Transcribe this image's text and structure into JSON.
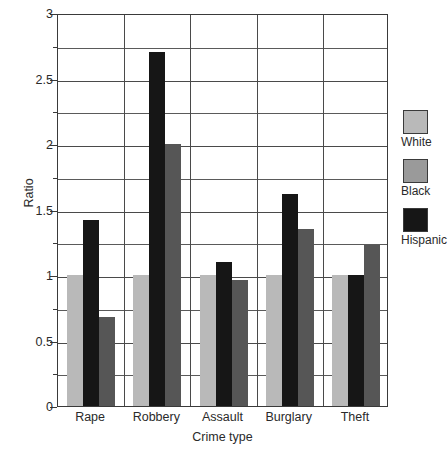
{
  "chart_data": {
    "type": "bar",
    "title": "",
    "xlabel": "Crime type",
    "ylabel": "Ratio",
    "categories": [
      "Rape",
      "Robbery",
      "Assault",
      "Burglary",
      "Theft"
    ],
    "series": [
      {
        "name": "White",
        "color": "#b9b9b9",
        "values": [
          1.0,
          1.0,
          1.0,
          1.0,
          1.0
        ]
      },
      {
        "name": "Black",
        "color": "#161616",
        "values": [
          1.42,
          2.7,
          1.1,
          1.62,
          1.0
        ]
      },
      {
        "name": "Hispanic",
        "color": "#565656",
        "values": [
          0.68,
          2.0,
          0.96,
          1.35,
          1.23
        ]
      }
    ],
    "ylim": [
      0,
      3
    ],
    "ymajor_ticks": [
      "0",
      "0.5",
      "1",
      "1.5",
      "2",
      "2.5",
      "3"
    ],
    "ymajor_values": [
      0,
      0.5,
      1,
      1.5,
      2,
      2.5,
      3
    ],
    "yminor_values": [
      0.25,
      0.75,
      1.25,
      1.75,
      2.25,
      2.75
    ],
    "grid": true,
    "legend_position": "right",
    "legend": [
      {
        "label": "White",
        "swatch_color": "#b9b9b9"
      },
      {
        "label": "Black",
        "swatch_color": "#9a9a9a"
      },
      {
        "label": "Hispanic",
        "swatch_color": "#161616"
      }
    ]
  }
}
